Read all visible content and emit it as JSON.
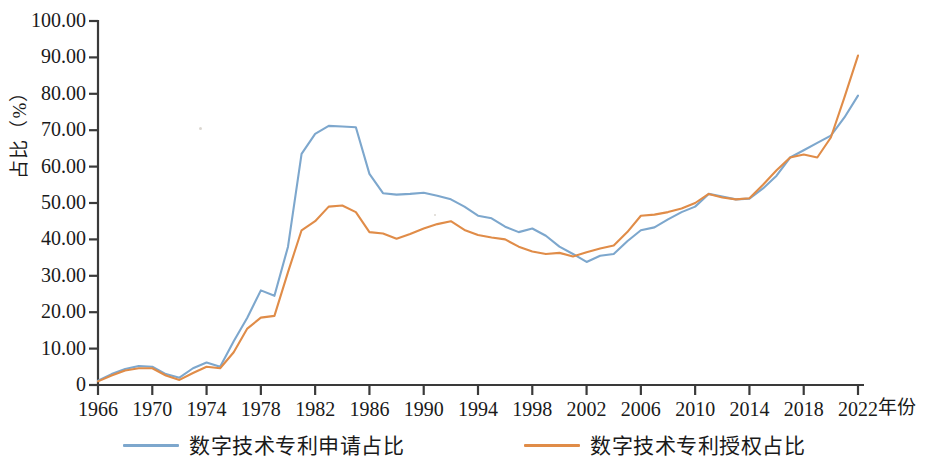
{
  "chart_data": {
    "type": "line",
    "title": "",
    "xlabel": "年份",
    "ylabel": "占比（%）",
    "xlim": [
      1966,
      2022
    ],
    "ylim": [
      0,
      100
    ],
    "grid": false,
    "legend_position": "bottom",
    "y_ticks": [
      0,
      10,
      20,
      30,
      40,
      50,
      60,
      70,
      80,
      90,
      100
    ],
    "y_tick_labels": [
      "0",
      "10.00",
      "20.00",
      "30.00",
      "40.00",
      "50.00",
      "60.00",
      "70.00",
      "80.00",
      "90.00",
      "100.00"
    ],
    "x_ticks": [
      1966,
      1970,
      1974,
      1978,
      1982,
      1986,
      1990,
      1994,
      1998,
      2002,
      2006,
      2010,
      2014,
      2018,
      2022
    ],
    "x_tick_labels": [
      "1966",
      "1970",
      "1974",
      "1978",
      "1982",
      "1986",
      "1990",
      "1994",
      "1998",
      "2002",
      "2006",
      "2010",
      "2014",
      "2018",
      "2022"
    ],
    "x": [
      1966,
      1967,
      1968,
      1969,
      1970,
      1971,
      1972,
      1973,
      1974,
      1975,
      1976,
      1977,
      1978,
      1979,
      1980,
      1981,
      1982,
      1983,
      1984,
      1985,
      1986,
      1987,
      1988,
      1989,
      1990,
      1991,
      1992,
      1993,
      1994,
      1995,
      1996,
      1997,
      1998,
      1999,
      2000,
      2001,
      2002,
      2003,
      2004,
      2005,
      2006,
      2007,
      2008,
      2009,
      2010,
      2011,
      2012,
      2013,
      2014,
      2015,
      2016,
      2017,
      2018,
      2019,
      2020,
      2021,
      2022
    ],
    "series": [
      {
        "name": "数字技术专利申请占比",
        "color": "#7da7cd",
        "values": [
          1.2,
          3.0,
          4.4,
          5.2,
          5.0,
          3.0,
          2.0,
          4.6,
          6.2,
          5.0,
          12.0,
          18.5,
          26.0,
          24.5,
          38.0,
          63.5,
          69.0,
          71.2,
          71.0,
          70.8,
          58.0,
          52.7,
          52.3,
          52.5,
          52.8,
          52.0,
          51.0,
          49.0,
          46.5,
          45.8,
          43.5,
          42.0,
          43.0,
          41.0,
          38.0,
          36.0,
          33.8,
          35.5,
          36.0,
          39.5,
          42.5,
          43.3,
          45.5,
          47.5,
          49.0,
          52.5,
          51.8,
          51.0,
          51.2,
          54.0,
          57.5,
          62.5,
          64.5,
          66.5,
          68.5,
          73.5,
          79.5
        ]
      },
      {
        "name": "数字技术专利授权占比",
        "color": "#e08c48",
        "values": [
          1.0,
          2.6,
          4.0,
          4.6,
          4.6,
          2.6,
          1.4,
          3.3,
          5.0,
          4.6,
          9.0,
          15.5,
          18.5,
          19.0,
          31.0,
          42.5,
          45.0,
          49.0,
          49.3,
          47.5,
          42.0,
          41.6,
          40.2,
          41.5,
          43.0,
          44.2,
          45.0,
          42.6,
          41.2,
          40.5,
          40.0,
          38.0,
          36.7,
          36.0,
          36.3,
          35.3,
          36.5,
          37.5,
          38.3,
          42.0,
          46.5,
          46.8,
          47.5,
          48.5,
          50.0,
          52.5,
          51.5,
          51.0,
          51.3,
          55.0,
          59.0,
          62.5,
          63.3,
          62.5,
          68.0,
          79.0,
          90.5
        ]
      }
    ]
  },
  "axis": {
    "line_color": "#3a3a3a"
  }
}
